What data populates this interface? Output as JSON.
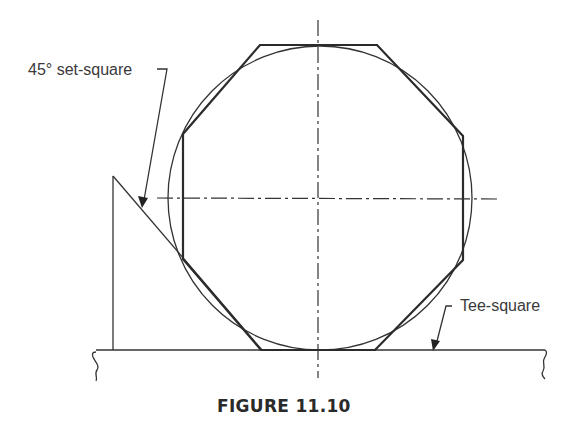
{
  "figure": {
    "caption": "FIGURE 11.10",
    "labels": {
      "set_square": "45° set-square",
      "tee_square": "Tee-square"
    },
    "colors": {
      "line": "#2b2b2b",
      "background": "#ffffff"
    }
  }
}
